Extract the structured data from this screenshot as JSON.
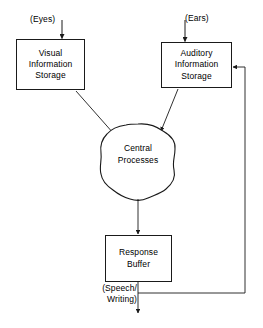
{
  "diagram": {
    "type": "flowchart",
    "stroke_color": "#1a1a1a",
    "background_color": "#ffffff",
    "nodes": [
      {
        "id": "visual-information-storage",
        "shape": "rectangle",
        "lines": [
          "Visual",
          "Information",
          "Storage"
        ]
      },
      {
        "id": "auditory-information-storage",
        "shape": "rectangle",
        "lines": [
          "Auditory",
          "Information",
          "Storage"
        ]
      },
      {
        "id": "central-processes",
        "shape": "irregular-blob",
        "lines": [
          "Central",
          "Processes"
        ]
      },
      {
        "id": "response-buffer",
        "shape": "rectangle",
        "lines": [
          "Response",
          "Buffer"
        ]
      }
    ],
    "edge_labels": {
      "eyes": "(Eyes)",
      "ears": "(Ears)",
      "speech": "(Speech/",
      "writing": "Writing)"
    },
    "edges": [
      {
        "name": "eyes-to-visual",
        "from": "(Eyes)",
        "to": "Visual Information Storage",
        "arrow": true
      },
      {
        "name": "ears-to-auditory",
        "from": "(Ears)",
        "to": "Auditory Information Storage",
        "arrow": true
      },
      {
        "name": "visual-to-central",
        "from": "Visual Information Storage",
        "to": "Central Processes",
        "arrow": true
      },
      {
        "name": "auditory-to-central",
        "from": "Auditory Information Storage",
        "to": "Central Processes",
        "arrow": true
      },
      {
        "name": "central-to-response-buffer",
        "from": "Central Processes",
        "to": "Response Buffer",
        "arrow": true
      },
      {
        "name": "response-buffer-output",
        "from": "Response Buffer",
        "to": "(Speech/Writing)",
        "arrow": true
      },
      {
        "name": "feedback-to-auditory",
        "from": "Response Buffer output",
        "to": "Auditory Information Storage",
        "arrow": true
      }
    ]
  }
}
